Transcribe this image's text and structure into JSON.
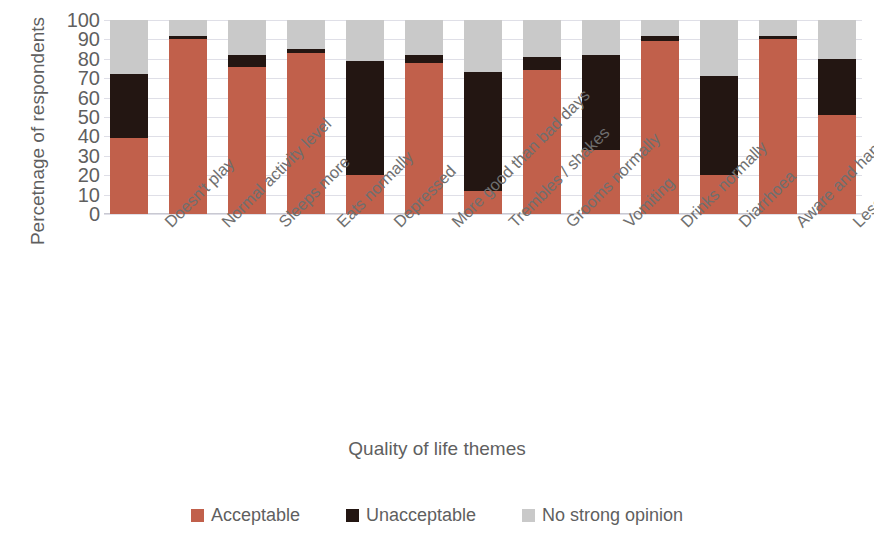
{
  "chart_data": {
    "type": "bar",
    "subtype": "stacked-column-100",
    "title": "",
    "xlabel": "Quality of life themes",
    "ylabel": "Percetnage of respondents",
    "ylim": [
      0,
      100
    ],
    "yticks": [
      0,
      10,
      20,
      30,
      40,
      50,
      60,
      70,
      80,
      90,
      100
    ],
    "grid": true,
    "legend_position": "bottom",
    "categories": [
      "Doesn't play",
      "Normal activity level",
      "Sleeps more",
      "Eats normally",
      "Depressed",
      "More good than bad days",
      "Trembles / shakes",
      "Grooms normally",
      "Vomiting",
      "Drinks normally",
      "Diarrhoea",
      "Aware and happy",
      "Less active"
    ],
    "series": [
      {
        "name": "Acceptable",
        "color": "#c1604b",
        "values": [
          39,
          90,
          76,
          83,
          20,
          78,
          12,
          74,
          33,
          89,
          20,
          90,
          51
        ]
      },
      {
        "name": "Unacceptable",
        "color": "#231612",
        "values": [
          33,
          2,
          6,
          2,
          59,
          4,
          61,
          7,
          49,
          3,
          51,
          2,
          29
        ]
      },
      {
        "name": "No strong opinion",
        "color": "#c9c9c9",
        "values": [
          28,
          8,
          18,
          15,
          21,
          18,
          27,
          19,
          18,
          8,
          29,
          8,
          20
        ]
      }
    ]
  },
  "legend": {
    "items": [
      {
        "label": "Acceptable",
        "color": "#c1604b"
      },
      {
        "label": "Unacceptable",
        "color": "#231612"
      },
      {
        "label": "No strong opinion",
        "color": "#c9c9c9"
      }
    ]
  }
}
